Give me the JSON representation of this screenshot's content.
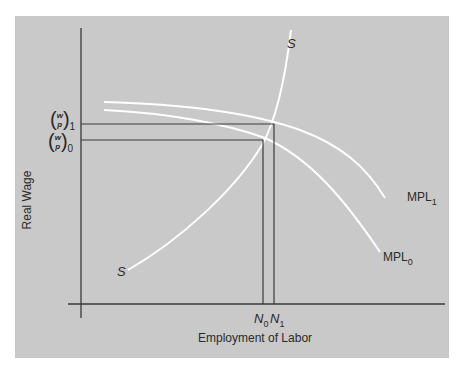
{
  "diagram": {
    "title": "",
    "axes": {
      "y_label": "Real Wage",
      "x_label": "Employment of Labor"
    },
    "y_ticks": [
      {
        "id": "w_p_1",
        "numerator": "w",
        "denominator": "p",
        "subscript": "1",
        "y": 124
      },
      {
        "id": "w_p_0",
        "numerator": "w",
        "denominator": "p",
        "subscript": "0",
        "y": 140
      }
    ],
    "x_ticks": [
      {
        "id": "N0",
        "label": "N",
        "subscript": "0",
        "x": 263
      },
      {
        "id": "N1",
        "label": "N",
        "subscript": "1",
        "x": 274
      }
    ],
    "curves": [
      {
        "id": "supply",
        "label_top": "S",
        "label_bottom": "S",
        "color": "#ffffff"
      },
      {
        "id": "mpl1",
        "label": "MPL",
        "subscript": "1",
        "color": "#ffffff"
      },
      {
        "id": "mpl0",
        "label": "MPL",
        "subscript": "0",
        "color": "#ffffff"
      }
    ],
    "colors": {
      "panel": "#c9c9c9",
      "axis": "#3a3a3a",
      "curve": "#ffffff",
      "text": "#2a2a2a"
    }
  }
}
